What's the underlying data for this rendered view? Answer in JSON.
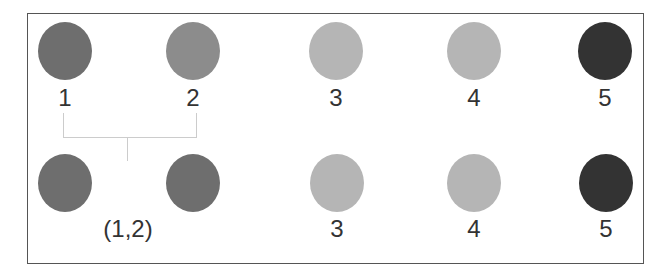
{
  "diagram": {
    "top_row": [
      {
        "label": "1",
        "color": "#6e6e6e"
      },
      {
        "label": "2",
        "color": "#8c8c8c"
      },
      {
        "label": "3",
        "color": "#b5b5b5"
      },
      {
        "label": "4",
        "color": "#b5b5b5"
      },
      {
        "label": "5",
        "color": "#333333"
      }
    ],
    "bottom_row": [
      {
        "label": "(1,2)",
        "color": "#6e6e6e"
      },
      {
        "label": "",
        "color": "#6e6e6e"
      },
      {
        "label": "3",
        "color": "#b5b5b5"
      },
      {
        "label": "4",
        "color": "#b5b5b5"
      },
      {
        "label": "5",
        "color": "#333333"
      }
    ],
    "merge_bracket": {
      "from": "1",
      "to": "2",
      "result": "(1,2)"
    }
  }
}
